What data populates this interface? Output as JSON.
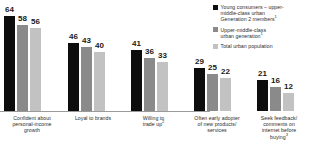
{
  "chart_data": {
    "type": "bar",
    "title": "",
    "subtitle": "",
    "xlabel": "",
    "ylabel": "",
    "ylim": [
      0,
      70
    ],
    "grid": false,
    "legend_position": "right",
    "categories": [
      "Confident about personal-income growth",
      "Loyal to brands",
      "Willing to trade up",
      "Often early adopter of new products/services",
      "Seek feedback/comments on internet before buying"
    ],
    "category_lines": [
      [
        "Confident about",
        "personal-income",
        "growth"
      ],
      [
        "Loyal to brands"
      ],
      [
        "Willing to",
        "trade up"
      ],
      [
        "Often early adopter",
        "of new products/",
        "services"
      ],
      [
        "Seek feedback/",
        "comments on",
        "internet before",
        "buying"
      ]
    ],
    "category_superscripts": [
      "",
      "",
      "2",
      "",
      "3"
    ],
    "series": [
      {
        "name": "Young consumers – upper-middle-class urban Generation 2 members",
        "color": "#0d0d0d",
        "values": [
          64,
          46,
          41,
          29,
          21
        ]
      },
      {
        "name": "Upper-middle-class urban generation",
        "color": "#8a8a8a",
        "values": [
          58,
          43,
          36,
          25,
          16
        ]
      },
      {
        "name": "Total urban population",
        "color": "#c2c2c2",
        "values": [
          56,
          40,
          33,
          22,
          12
        ]
      }
    ]
  },
  "legend": {
    "items": [
      {
        "color": "#0d0d0d",
        "lines": [
          "Young consumers – upper-",
          "middle-class urban",
          "Generation 2 members"
        ],
        "superscript": "1"
      },
      {
        "color": "#8a8a8a",
        "lines": [
          "Upper-middle-class",
          "urban generation"
        ],
        "superscript": "1"
      },
      {
        "color": "#c2c2c2",
        "lines": [
          "Total urban population"
        ],
        "superscript": ""
      }
    ]
  },
  "axis": {
    "baseline_color": "#9a9a9a"
  }
}
